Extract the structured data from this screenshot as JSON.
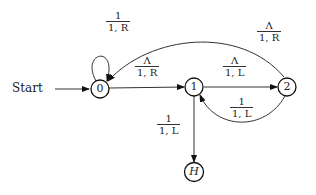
{
  "diagram": {
    "type": "turing-machine-state-diagram",
    "start_label": "Start",
    "states": [
      {
        "id": "0",
        "label": "0"
      },
      {
        "id": "1",
        "label": "1"
      },
      {
        "id": "2",
        "label": "2"
      },
      {
        "id": "H",
        "label": "H"
      }
    ],
    "transitions": [
      {
        "from": "0",
        "to": "0",
        "read": "1",
        "write_move": "1, R",
        "move": "R"
      },
      {
        "from": "0",
        "to": "1",
        "read": "Λ",
        "write_move": "1, R",
        "move": "R"
      },
      {
        "from": "1",
        "to": "2",
        "read": "Λ",
        "write_move": "1, L",
        "move": "L"
      },
      {
        "from": "2",
        "to": "0",
        "read": "Λ",
        "write_move": "1, R",
        "move": "R"
      },
      {
        "from": "2",
        "to": "1",
        "read": "1",
        "write_move": "1, L",
        "move": "L"
      },
      {
        "from": "1",
        "to": "H",
        "read": "1",
        "write_move": "1, L",
        "move": "L"
      }
    ]
  }
}
